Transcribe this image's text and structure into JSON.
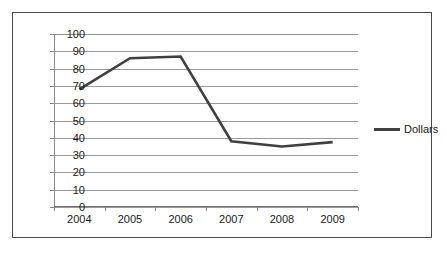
{
  "chart_data": {
    "type": "line",
    "title": "",
    "xlabel": "",
    "ylabel": "",
    "categories": [
      "2004",
      "2005",
      "2006",
      "2007",
      "2008",
      "2009"
    ],
    "series": [
      {
        "name": "Dollars",
        "values": [
          68,
          86,
          87,
          38,
          35,
          37.5
        ],
        "color": "#404040"
      }
    ],
    "ylim": [
      0,
      100
    ],
    "ytick_values": [
      0,
      10,
      20,
      30,
      40,
      50,
      60,
      70,
      80,
      90,
      100
    ],
    "ytick_labels": [
      "0",
      "10",
      "20",
      "30",
      "40",
      "50",
      "60",
      "70",
      "80",
      "90",
      "100"
    ],
    "grid": true,
    "grid_axis": "y",
    "legend_position": "right",
    "legend_entries": [
      "Dollars"
    ],
    "annotations": []
  },
  "legend": {
    "label": "Dollars",
    "swatch_icon": "line-swatch-icon"
  },
  "colors": {
    "series_line": "#404040",
    "gridline": "#9a9a9a",
    "axis": "#8a8a8a",
    "border": "#4a4a4a",
    "background": "#ffffff",
    "text": "#1a1a1a"
  }
}
